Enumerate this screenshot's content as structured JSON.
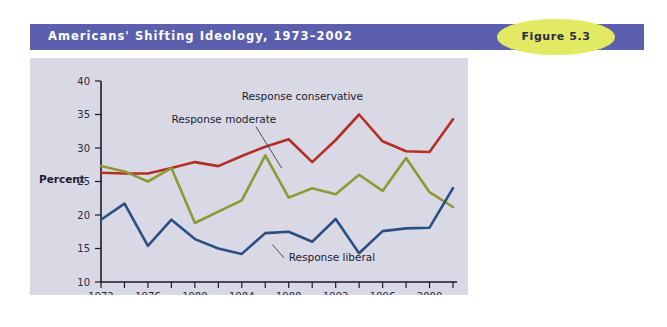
{
  "header": {
    "title": "Americans' Shifting Ideology, 1973–2002",
    "band_color": "#5b5fae",
    "title_color": "#ffffff",
    "badge_label": "Figure 5.3",
    "badge_color": "#e2ea63"
  },
  "panel": {
    "background_color": "#d9d9e6"
  },
  "chart_data": {
    "type": "line",
    "title": "Americans' Shifting Ideology, 1973–2002",
    "xlabel": "",
    "ylabel": "Percent",
    "xlim": [
      1972,
      2002
    ],
    "ylim": [
      10,
      40
    ],
    "grid": false,
    "legend": "inline-annotations",
    "y_ticks": [
      10,
      15,
      20,
      25,
      30,
      35,
      40
    ],
    "x_ticks": [
      1972,
      1974,
      1976,
      1978,
      1980,
      1982,
      1984,
      1986,
      1988,
      1990,
      1992,
      1994,
      1996,
      1998,
      2000,
      2002
    ],
    "x_tick_labels": [
      "1972",
      "",
      "1976",
      "",
      "1980",
      "",
      "1984",
      "",
      "1988",
      "",
      "1992",
      "",
      "1996",
      "",
      "2000",
      ""
    ],
    "x": [
      1972,
      1974,
      1976,
      1978,
      1980,
      1982,
      1984,
      1986,
      1988,
      1990,
      1992,
      1994,
      1996,
      1998,
      2000,
      2002
    ],
    "series": [
      {
        "name": "Response conservative",
        "color": "#b52e22",
        "label_x": 1984,
        "label_y": 37.2,
        "values": [
          26.3,
          26.2,
          26.2,
          27.0,
          27.9,
          27.3,
          28.8,
          30.2,
          31.3,
          27.9,
          31.2,
          35.0,
          31.0,
          29.5,
          29.4,
          34.3
        ]
      },
      {
        "name": "Response moderate",
        "color": "#8b9a35",
        "label_x": 1978,
        "label_y": 33.8,
        "values": [
          27.3,
          26.5,
          25.0,
          27.0,
          18.8,
          20.5,
          22.2,
          28.9,
          22.6,
          24.0,
          23.1,
          26.0,
          23.6,
          28.5,
          23.4,
          21.2
        ]
      },
      {
        "name": "Response liberal",
        "color": "#2a4f82",
        "label_x": 1988,
        "label_y": 13.2,
        "values": [
          19.3,
          21.7,
          15.4,
          19.3,
          16.4,
          15.0,
          14.2,
          17.3,
          17.5,
          16.0,
          19.4,
          14.3,
          17.6,
          18.0,
          18.1,
          24.0
        ]
      }
    ]
  }
}
